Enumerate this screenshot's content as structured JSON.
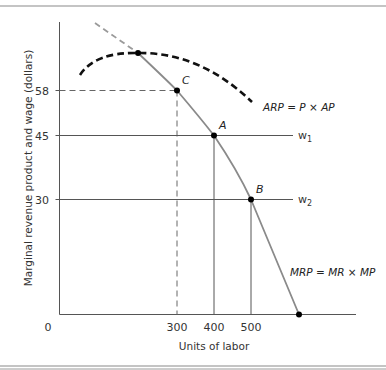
{
  "chart_data": {
    "type": "line",
    "title": "",
    "xlabel": "Units of labor",
    "ylabel": "Marginal revenue product and wage (dollars)",
    "origin_label": "0",
    "x_ticks": [
      "300",
      "400",
      "500"
    ],
    "y_ticks": [
      "58",
      "45",
      "30"
    ],
    "grid": false,
    "series": [
      {
        "name": "MRP = MR × MP",
        "style": "solid gray, dashed gray above ARP maximum",
        "label_parts": [
          "MRP",
          " = ",
          "MR",
          " × ",
          "MP"
        ]
      },
      {
        "name": "ARP = P × AP",
        "style": "heavy black dashed, inverted U",
        "label_parts": [
          "ARP",
          " = ",
          "P",
          " × ",
          "AP"
        ]
      }
    ],
    "wage_lines": [
      {
        "name": "w1",
        "base": "w",
        "sub": "1",
        "value": 45
      },
      {
        "name": "w2",
        "base": "w",
        "sub": "2",
        "value": 30
      }
    ],
    "points": [
      {
        "label": "C",
        "x": 300,
        "y": 58
      },
      {
        "label": "A",
        "x": 400,
        "y": 45
      },
      {
        "label": "B",
        "x": 500,
        "y": 30
      },
      {
        "label": "",
        "x": null,
        "y": null,
        "note": "MRP meets ARP at ARP maximum"
      },
      {
        "label": "",
        "x": null,
        "y": 0,
        "note": "MRP reaches zero"
      }
    ]
  }
}
